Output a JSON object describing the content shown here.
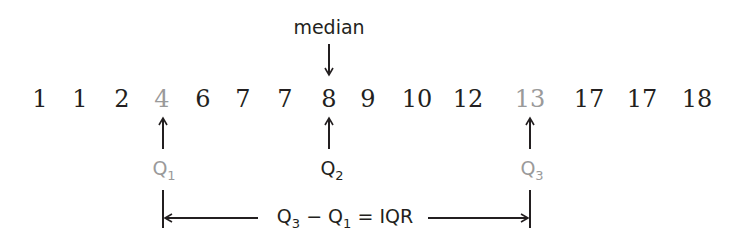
{
  "diagram": {
    "values": [
      {
        "text": "1",
        "x": 40,
        "highlight": false
      },
      {
        "text": "1",
        "x": 80,
        "highlight": false
      },
      {
        "text": "2",
        "x": 122,
        "highlight": false
      },
      {
        "text": "4",
        "x": 162,
        "highlight": true
      },
      {
        "text": "6",
        "x": 203,
        "highlight": false
      },
      {
        "text": "7",
        "x": 243,
        "highlight": false
      },
      {
        "text": "7",
        "x": 285,
        "highlight": false
      },
      {
        "text": "8",
        "x": 329,
        "highlight": false
      },
      {
        "text": "9",
        "x": 368,
        "highlight": false
      },
      {
        "text": "10",
        "x": 417,
        "highlight": false
      },
      {
        "text": "12",
        "x": 468,
        "highlight": false
      },
      {
        "text": "13",
        "x": 530,
        "highlight": true
      },
      {
        "text": "17",
        "x": 589,
        "highlight": false
      },
      {
        "text": "17",
        "x": 642,
        "highlight": false
      },
      {
        "text": "18",
        "x": 697,
        "highlight": false
      }
    ],
    "median_label": "median",
    "quartiles": [
      {
        "letter": "Q",
        "sub": "1",
        "x": 164,
        "highlight": true
      },
      {
        "letter": "Q",
        "sub": "2",
        "x": 332,
        "highlight": false
      },
      {
        "letter": "Q",
        "sub": "3",
        "x": 532,
        "highlight": true
      }
    ],
    "iqr_formula": {
      "q3": "Q",
      "q3_sub": "3",
      "minus": "−",
      "q1": "Q",
      "q1_sub": "1",
      "equals": "=",
      "result": "IQR"
    },
    "colors": {
      "text": "#231f20",
      "highlight": "#9a9a9a"
    }
  }
}
